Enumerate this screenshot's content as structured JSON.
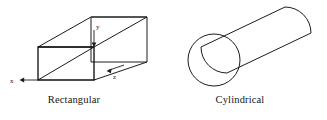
{
  "figure": {
    "background_color": "#ffffff",
    "line_color": "#1c1c1c",
    "shapes": [
      {
        "id": "rectangular-duct",
        "caption": "Rectangular",
        "type": "rectangular-box",
        "description": "Three-dimensional rectangular duct drawn in oblique projection with a front rectangular face, a diagonal line across the front face, and receding top and bottom edges to a rear face.",
        "axes": [
          {
            "name": "x",
            "label": "x",
            "direction": "left",
            "arrow": "left"
          },
          {
            "name": "y",
            "label": "y",
            "direction": "down",
            "arrow": "down"
          },
          {
            "name": "z",
            "label": "z",
            "direction": "right-down",
            "arrow": "right"
          }
        ]
      },
      {
        "id": "cylindrical-duct",
        "caption": "Cylindrical",
        "type": "cylinder",
        "description": "Three-dimensional cylindrical duct drawn tilted with the circular near end at the lower left and a rounded far cap at the upper right.",
        "axes": []
      }
    ],
    "captions": {
      "rectangular": "Rectangular",
      "cylindrical": "Cylindrical"
    },
    "axis_labels": {
      "x": "x",
      "y": "y",
      "z": "z"
    }
  }
}
